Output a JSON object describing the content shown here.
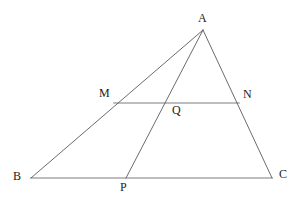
{
  "diagram": {
    "type": "euclidean-geometry-figure",
    "background_color": "#ffffff",
    "stroke_color_thin": "#5a5a5a",
    "stroke_color_light": "#bdbdbd",
    "label_color": "#1c1c1c",
    "canvas": {
      "width": 302,
      "height": 199
    },
    "points": [
      {
        "id": "A",
        "label": "A",
        "x": 203,
        "y": 30,
        "label_x": 198,
        "label_y": 12
      },
      {
        "id": "B",
        "label": "B",
        "x": 31,
        "y": 178,
        "label_x": 13,
        "label_y": 170
      },
      {
        "id": "C",
        "label": "C",
        "x": 272,
        "y": 178,
        "label_x": 279,
        "label_y": 168
      },
      {
        "id": "M",
        "label": "M",
        "x": 114,
        "y": 103,
        "label_x": 99,
        "label_y": 87
      },
      {
        "id": "N",
        "label": "N",
        "x": 239,
        "y": 103,
        "label_x": 243,
        "label_y": 88
      },
      {
        "id": "P",
        "label": "P",
        "x": 126,
        "y": 178,
        "label_x": 120,
        "label_y": 181
      },
      {
        "id": "Q",
        "label": "Q",
        "x": 172,
        "y": 103,
        "label_x": 172,
        "label_y": 104
      }
    ],
    "segments": [
      {
        "id": "AB",
        "from": "A",
        "to": "B",
        "style": "thin-dark",
        "x1": 203,
        "y1": 30,
        "x2": 31,
        "y2": 178
      },
      {
        "id": "AC",
        "from": "A",
        "to": "C",
        "style": "thin-dark",
        "x1": 203,
        "y1": 30,
        "x2": 272,
        "y2": 178
      },
      {
        "id": "AP",
        "from": "A",
        "to": "P",
        "style": "thin-dark",
        "x1": 203,
        "y1": 30,
        "x2": 126,
        "y2": 178
      },
      {
        "id": "BC",
        "from": "B",
        "to": "C",
        "style": "thick-light",
        "x1": 31,
        "y1": 178,
        "x2": 272,
        "y2": 178
      },
      {
        "id": "MN",
        "from": "M",
        "to": "N",
        "style": "thick-light",
        "x1": 114,
        "y1": 103,
        "x2": 239,
        "y2": 103
      }
    ]
  }
}
